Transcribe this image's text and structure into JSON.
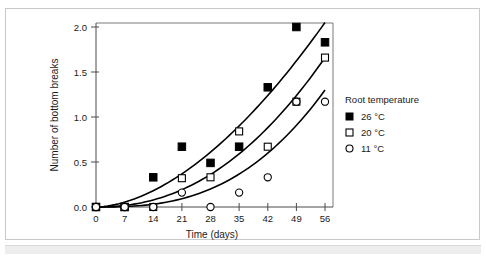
{
  "chart_data": {
    "type": "scatter",
    "title": "",
    "xlabel": "Time (days)",
    "ylabel": "Number of bottom breaks",
    "xlim": [
      0,
      56
    ],
    "ylim": [
      0.0,
      2.0
    ],
    "xticks": [
      0,
      7,
      14,
      21,
      28,
      35,
      42,
      49,
      56
    ],
    "xtick_labels": [
      "0",
      "7",
      "14",
      "21",
      "28",
      "35",
      "42",
      "49",
      "56"
    ],
    "yticks": [
      0.0,
      0.5,
      1.0,
      1.5,
      2.0
    ],
    "ytick_labels": [
      "0.0",
      "0.5",
      "1.0",
      "1.5",
      "2.0"
    ],
    "grid": false,
    "legend_position": "right",
    "legend_title": "Root temperature",
    "x": [
      0,
      7,
      14,
      21,
      28,
      35,
      42,
      49,
      56
    ],
    "series": [
      {
        "name": "26 °C",
        "marker": "filled-square",
        "color": "#000000",
        "values": [
          0.0,
          0.0,
          0.33,
          0.67,
          0.49,
          0.67,
          1.33,
          2.0,
          1.83
        ],
        "fit": {
          "type": "exponential",
          "note": "fitted curve rising to ~2.05 at day 56"
        }
      },
      {
        "name": "20 °C",
        "marker": "open-square",
        "color": "#000000",
        "values": [
          0.0,
          0.0,
          0.0,
          0.32,
          0.33,
          0.84,
          0.67,
          1.17,
          1.66
        ],
        "fit": {
          "type": "exponential",
          "note": "fitted curve rising to ~1.66 at day 56"
        }
      },
      {
        "name": "11 °C",
        "marker": "open-circle",
        "color": "#000000",
        "values": [
          0.0,
          0.0,
          0.0,
          0.16,
          0.0,
          0.16,
          0.33,
          1.17,
          1.17
        ],
        "fit": {
          "type": "exponential",
          "note": "fitted curve rising to ~1.30 at day 56"
        }
      }
    ]
  },
  "legend": {
    "title": "Root temperature",
    "items": [
      {
        "label": "26 °C",
        "marker": "filled-square"
      },
      {
        "label": "20 °C",
        "marker": "open-square"
      },
      {
        "label": "11 °C",
        "marker": "open-circle"
      }
    ]
  },
  "axes": {
    "x_title": "Time (days)",
    "y_title": "Number of bottom breaks"
  }
}
